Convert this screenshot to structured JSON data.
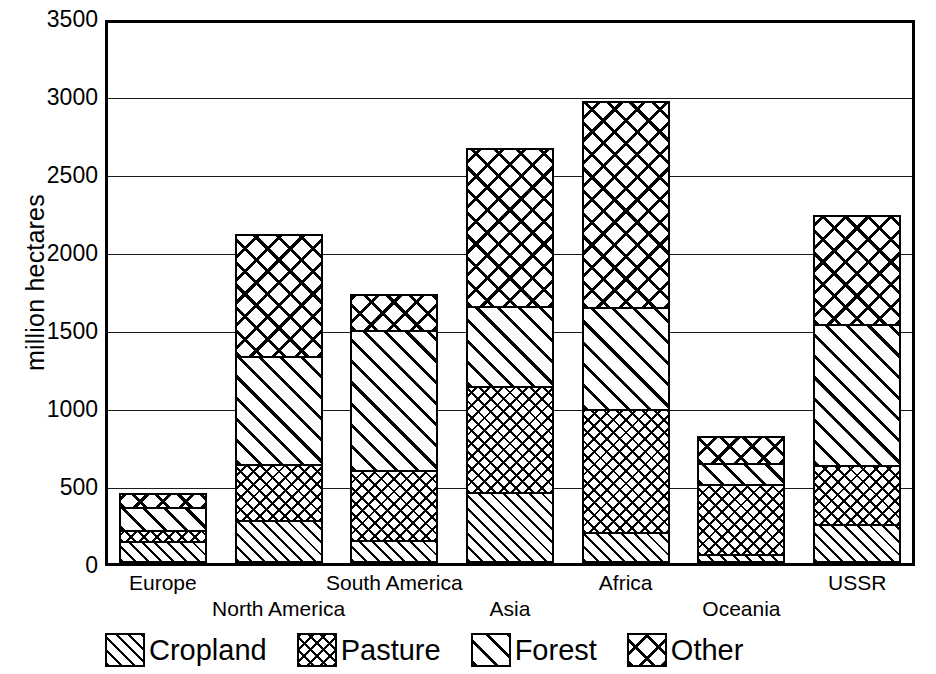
{
  "chart_data": {
    "type": "bar",
    "subtype": "stacked-bar",
    "title": "",
    "xlabel": "",
    "ylabel": "million hectares",
    "ylim": [
      0,
      3500
    ],
    "ytick_step": 500,
    "ytick_labels": [
      "0",
      "500",
      "1000",
      "1500",
      "2000",
      "2500",
      "3000",
      "3500"
    ],
    "ytick_values": [
      0,
      500,
      1000,
      1500,
      2000,
      2500,
      3000,
      3500
    ],
    "grid": true,
    "grid_axis": "y",
    "legend_position": "bottom",
    "categories": [
      "Europe",
      "North America",
      "South America",
      "Asia",
      "Africa",
      "Oceania",
      "USSR"
    ],
    "series": [
      {
        "name": "Cropland",
        "pattern": "fine-diagonal-hatch",
        "values": [
          140,
          275,
          150,
          455,
          200,
          60,
          250
        ]
      },
      {
        "name": "Pasture",
        "pattern": "fine-crosshatch",
        "values": [
          85,
          375,
          460,
          690,
          800,
          460,
          390
        ]
      },
      {
        "name": "Forest",
        "pattern": "coarse-diagonal-hatch",
        "values": [
          160,
          700,
          910,
          530,
          670,
          145,
          920
        ]
      },
      {
        "name": "Other",
        "pattern": "coarse-crosshatch",
        "values": [
          105,
          800,
          240,
          1025,
          1330,
          190,
          710
        ]
      }
    ],
    "totals": [
      490,
      2150,
      1760,
      2700,
      3000,
      855,
      2270
    ]
  },
  "axis": {
    "y_title": "million hectares"
  },
  "legend": {
    "items": [
      {
        "label": "Cropland",
        "pattern": "pat-cropland"
      },
      {
        "label": "Pasture",
        "pattern": "pat-pasture"
      },
      {
        "label": "Forest",
        "pattern": "pat-forest"
      },
      {
        "label": "Other",
        "pattern": "pat-other"
      }
    ]
  },
  "colors": {
    "ink": "#000000",
    "background": "#ffffff",
    "gridline": "#1a1a1a"
  }
}
